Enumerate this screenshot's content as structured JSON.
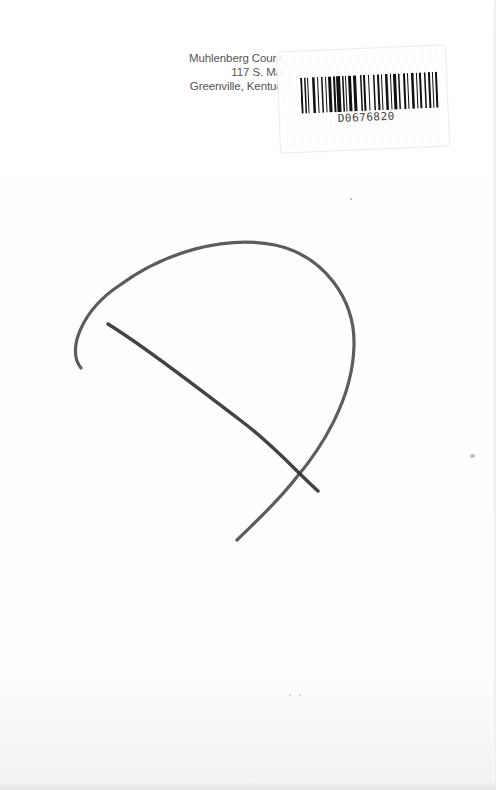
{
  "page": {
    "type": "scanned-book-page",
    "background_color": "#fdfdfd"
  },
  "library_stamp": {
    "lines": [
      "Muhlenberg Count",
      "117 S. Ma",
      "Greenville, Kentuc"
    ],
    "color": "#555555"
  },
  "barcode_label": {
    "number": "D0676820",
    "bar_color": "#111111"
  },
  "pencil_marks": {
    "description": "Hand-drawn pencil arc with a crossing diagonal stroke",
    "stroke_color": "#3a3a3a"
  }
}
